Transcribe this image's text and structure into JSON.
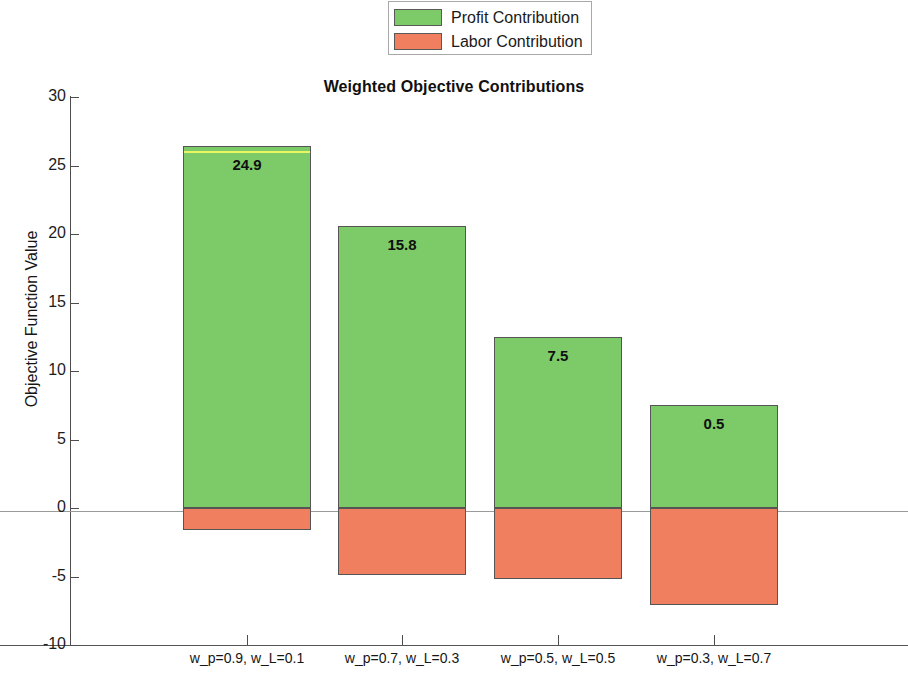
{
  "chart_data": {
    "type": "bar",
    "subtype": "stacked-diverging",
    "title": "Weighted Objective Contributions",
    "xlabel": "",
    "ylabel": "Objective Function Value",
    "ylim": [
      -10,
      30
    ],
    "yticks": [
      30,
      25,
      20,
      15,
      10,
      5,
      0,
      -5,
      -10
    ],
    "grid": false,
    "legend_position": "top-center",
    "categories": [
      "w_p=0.9, w_L=0.1",
      "w_p=0.7, w_L=0.3",
      "w_p=0.5, w_L=0.5",
      "w_p=0.3, w_L=0.7"
    ],
    "series": [
      {
        "name": "Profit Contribution",
        "color": "#7ccb68",
        "values": [
          26.4,
          20.6,
          12.5,
          7.5
        ]
      },
      {
        "name": "Labor Contribution",
        "color": "#ef7f5f",
        "values": [
          -1.6,
          -4.9,
          -5.2,
          -7.1
        ]
      }
    ],
    "data_labels": [
      "24.9",
      "15.8",
      "7.5",
      "0.5"
    ],
    "data_label_values": [
      24.9,
      15.8,
      7.5,
      0.5
    ],
    "highlight_color": "#eaf564",
    "highlighted_bar_index": 0
  },
  "legend": {
    "items": [
      {
        "label": "Profit Contribution",
        "color": "#7ccb68"
      },
      {
        "label": "Labor Contribution",
        "color": "#ef7f5f"
      }
    ]
  },
  "axes": {
    "y_tick_labels": [
      "30",
      "25",
      "20",
      "15",
      "10",
      "5",
      "0",
      "-5",
      "-10"
    ],
    "x_tick_labels": [
      "w_p=0.9, w_L=0.1",
      "w_p=0.7, w_L=0.3",
      "w_p=0.5, w_L=0.5",
      "w_p=0.3, w_L=0.7"
    ],
    "y_title": "Objective Function Value"
  }
}
